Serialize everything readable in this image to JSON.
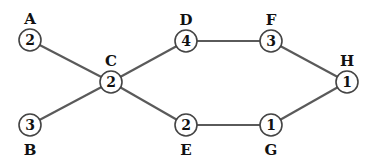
{
  "diagram": {
    "type": "graph",
    "nodes": [
      {
        "id": "A",
        "label": "A",
        "value": "2"
      },
      {
        "id": "B",
        "label": "B",
        "value": "3"
      },
      {
        "id": "C",
        "label": "C",
        "value": "2"
      },
      {
        "id": "D",
        "label": "D",
        "value": "4"
      },
      {
        "id": "E",
        "label": "E",
        "value": "2"
      },
      {
        "id": "F",
        "label": "F",
        "value": "3"
      },
      {
        "id": "G",
        "label": "G",
        "value": "1"
      },
      {
        "id": "H",
        "label": "H",
        "value": "1"
      }
    ],
    "edges": [
      {
        "from": "A",
        "to": "C"
      },
      {
        "from": "B",
        "to": "C"
      },
      {
        "from": "C",
        "to": "D"
      },
      {
        "from": "C",
        "to": "E"
      },
      {
        "from": "D",
        "to": "F"
      },
      {
        "from": "E",
        "to": "G"
      },
      {
        "from": "F",
        "to": "H"
      },
      {
        "from": "G",
        "to": "H"
      }
    ]
  }
}
